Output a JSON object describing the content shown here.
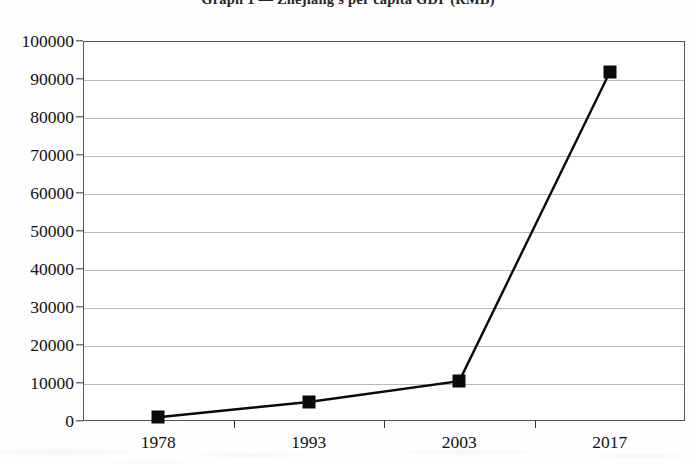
{
  "chart_data": {
    "type": "line",
    "title": "Graph 1 — Zhejiang's per capita GDP (RMB)",
    "xlabel": "",
    "ylabel": "",
    "categories": [
      "1978",
      "1993",
      "2003",
      "2017"
    ],
    "values": [
      1000,
      5000,
      10500,
      91800
    ],
    "series": [
      {
        "name": "per capita GDP (RMB)",
        "values": [
          1000,
          5000,
          10500,
          91800
        ]
      }
    ],
    "ylim": [
      0,
      100000
    ],
    "ytick_labels": [
      "0",
      "10000",
      "20000",
      "30000",
      "40000",
      "50000",
      "60000",
      "70000",
      "80000",
      "90000",
      "100000"
    ],
    "ytick_values": [
      0,
      10000,
      20000,
      30000,
      40000,
      50000,
      60000,
      70000,
      80000,
      90000,
      100000
    ],
    "grid": true,
    "grid_color": "#b9b9b9",
    "legend": false,
    "legend_position": "none",
    "marker": "filled-square",
    "marker_color": "#0a0a0a",
    "line_color": "#0a0a0a",
    "plot_border_color": "#555555",
    "background_color": "#ffffff"
  }
}
